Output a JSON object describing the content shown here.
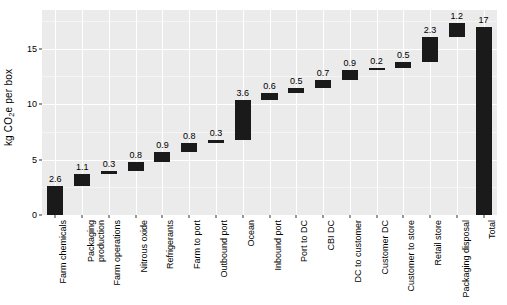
{
  "chart_data": {
    "type": "bar",
    "subtype": "waterfall",
    "title": "",
    "subtitle": "",
    "xlabel": "",
    "ylabel": "kg CO2e per box",
    "ylabel_parts": {
      "prefix": "kg CO",
      "sub": "2",
      "suffix": "e per box"
    },
    "ylim": [
      0,
      18.5
    ],
    "yticks": [
      0,
      5,
      10,
      15
    ],
    "ytick_labels": [
      "0",
      "5",
      "10",
      "15"
    ],
    "grid": true,
    "legend": null,
    "categories": [
      "Farm chemicals",
      "Packaging production",
      "Farm operations",
      "Nitrous oxide",
      "Refrigerants",
      "Farm to port",
      "Outbound port",
      "Ocean",
      "Inbound port",
      "Port to DC",
      "CBI DC",
      "DC to customer",
      "Customer DC",
      "Customer to store",
      "Retail store",
      "Packaging disposal",
      "Total"
    ],
    "values": [
      2.6,
      1.1,
      0.3,
      0.8,
      0.9,
      0.8,
      0.3,
      3.6,
      0.6,
      0.5,
      0.7,
      0.9,
      0.2,
      0.5,
      2.3,
      1.2,
      17
    ],
    "value_labels": [
      "2.6",
      "1.1",
      "0.3",
      "0.8",
      "0.9",
      "0.8",
      "0.3",
      "3.6",
      "0.6",
      "0.5",
      "0.7",
      "0.9",
      "0.2",
      "0.5",
      "2.3",
      "1.2",
      "17"
    ],
    "bar_bases": [
      0,
      2.6,
      3.7,
      4.0,
      4.8,
      5.7,
      6.5,
      6.8,
      10.4,
      11.0,
      11.5,
      12.2,
      13.1,
      13.3,
      13.8,
      16.1,
      0
    ],
    "bar_tops": [
      2.6,
      3.7,
      4.0,
      4.8,
      5.7,
      6.5,
      6.8,
      10.4,
      11.0,
      11.5,
      12.2,
      13.1,
      13.3,
      13.8,
      16.1,
      17.3,
      17
    ],
    "is_total": [
      false,
      false,
      false,
      false,
      false,
      false,
      false,
      false,
      false,
      false,
      false,
      false,
      false,
      false,
      false,
      false,
      true
    ],
    "bar_color": "#1a1a1a",
    "panel_color": "#ebebeb",
    "grid_color": "#ffffff",
    "text_color": "#000000"
  }
}
